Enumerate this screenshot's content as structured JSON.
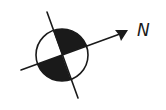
{
  "diagram": {
    "type": "north-arrow-symbol",
    "label": "N",
    "colors": {
      "ink": "#1a1a1a",
      "fill": "#1a1a1a",
      "background": "#ffffff"
    },
    "circle": {
      "cx": 62,
      "cy": 55,
      "r": 26
    },
    "axis_line": {
      "x1": 21,
      "y1": 70,
      "x2": 126,
      "y2": 32
    },
    "cross_line": {
      "x1": 47,
      "y1": 12,
      "x2": 78,
      "y2": 98
    },
    "filled_quadrants": [
      "upper-right",
      "lower-left"
    ]
  }
}
